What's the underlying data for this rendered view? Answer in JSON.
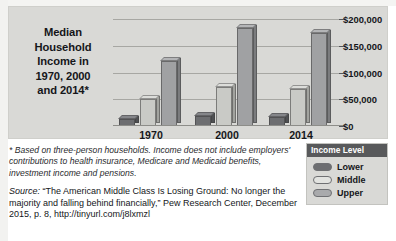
{
  "chart_data": {
    "type": "bar",
    "title": "Median Household Income in 1970, 2000 and 2014*",
    "title_lines": [
      "Median",
      "Household",
      "Income in",
      "1970, 2000",
      "and 2014*"
    ],
    "categories": [
      "1970",
      "2000",
      "2014"
    ],
    "series": [
      {
        "name": "Lower",
        "values": [
          14000,
          18000,
          16000
        ]
      },
      {
        "name": "Middle",
        "values": [
          50000,
          72000,
          70000
        ]
      },
      {
        "name": "Upper",
        "values": [
          122000,
          184000,
          174000
        ]
      }
    ],
    "xlabel": "",
    "ylabel": "",
    "ylim": [
      0,
      200000
    ],
    "ytick_values": [
      0,
      50000,
      100000,
      150000,
      200000
    ],
    "ytick_labels": [
      "$0",
      "$50,000",
      "$100,000",
      "$150,000",
      "$200,000"
    ],
    "grid": true,
    "legend_position": "bottom-right",
    "legend_title": "Income Level"
  },
  "legend": {
    "title": "Income Level",
    "items": [
      {
        "label": "Lower",
        "swatch": "#6d6e71"
      },
      {
        "label": "Middle",
        "swatch": "#e2e3e0"
      },
      {
        "label": "Upper",
        "swatch": "#a9aaac"
      }
    ]
  },
  "notes": {
    "footnote": "* Based on three-person households. Income does not include employers' contributions to health insurance, Medicare and Medicaid benefits, investment income and pensions.",
    "source_word": "Source:",
    "source_text": " “The American Middle Class Is Losing Ground: No longer the majority and falling behind financially,” Pew Research Center, December 2015, p. 8, http://tinyurl.com/j8lxmzl"
  },
  "colors": {
    "panel_background": "#d9d9d6",
    "legend_header": "#58595b",
    "text": "#15161a",
    "gridline": "#a7a7a3"
  }
}
